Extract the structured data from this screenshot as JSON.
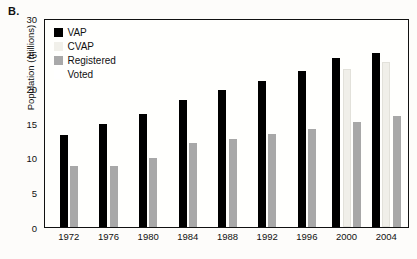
{
  "figure": {
    "panel_label": "B."
  },
  "chart_data": {
    "type": "bar",
    "title": "",
    "xlabel": "",
    "ylabel": "Population (millions)",
    "ylim": [
      0,
      30
    ],
    "yticks": [
      0,
      5,
      10,
      15,
      20,
      25,
      30
    ],
    "grid": false,
    "legend_position": "top-left",
    "categories": [
      "1972",
      "1976",
      "1980",
      "1984",
      "1988",
      "1992",
      "1996",
      "2000",
      "2004"
    ],
    "series": [
      {
        "name": "VAP",
        "color": "#000000",
        "values": [
          13.2,
          14.8,
          16.2,
          18.3,
          19.6,
          21.0,
          22.4,
          24.2,
          25.0
        ]
      },
      {
        "name": "CVAP",
        "color": "#f0efe9",
        "values": [
          null,
          null,
          null,
          null,
          null,
          null,
          null,
          22.7,
          23.7
        ]
      },
      {
        "name": "Registered",
        "color": "#a8a8a8",
        "values": [
          8.8,
          8.8,
          9.9,
          12.0,
          12.7,
          13.3,
          14.1,
          15.1,
          15.9
        ]
      },
      {
        "name": "Voted",
        "color": "#ffffff",
        "values": [
          null,
          null,
          null,
          null,
          null,
          null,
          null,
          null,
          null
        ]
      }
    ]
  }
}
